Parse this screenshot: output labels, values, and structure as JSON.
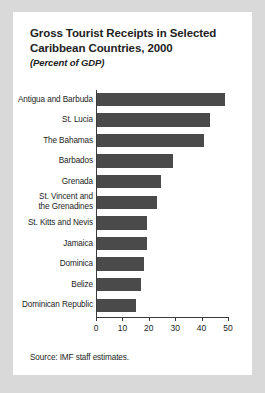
{
  "card": {
    "title_lines": [
      "Gross Tourist Receipts in Selected",
      "Caribbean Countries, 2000"
    ],
    "subtitle": "(Percent of GDP)",
    "source": "Source: IMF staff estimates."
  },
  "chart_data": {
    "type": "bar",
    "orientation": "horizontal",
    "title": "Gross Tourist Receipts in Selected Caribbean Countries, 2000",
    "subtitle": "(Percent of GDP)",
    "xlabel": "",
    "ylabel": "",
    "xlim": [
      0,
      50
    ],
    "xticks": [
      0,
      10,
      20,
      30,
      40,
      50
    ],
    "xtick_labels": [
      "0",
      "10",
      "20",
      "30",
      "40",
      "50"
    ],
    "grid": false,
    "legend": false,
    "bar_color": "#4a4a4a",
    "categories": [
      "Antigua and Barbuda",
      "St. Lucia",
      "The Bahamas",
      "Barbados",
      "Grenada",
      "St. Vincent and\nthe Grenadines",
      "St. Kitts and Nevis",
      "Jamaica",
      "Dominica",
      "Belize",
      "Dominican Republic"
    ],
    "values": [
      49,
      43,
      41,
      29,
      24.5,
      23,
      19.5,
      19.5,
      18,
      17,
      15
    ],
    "source": "Source: IMF staff estimates."
  }
}
